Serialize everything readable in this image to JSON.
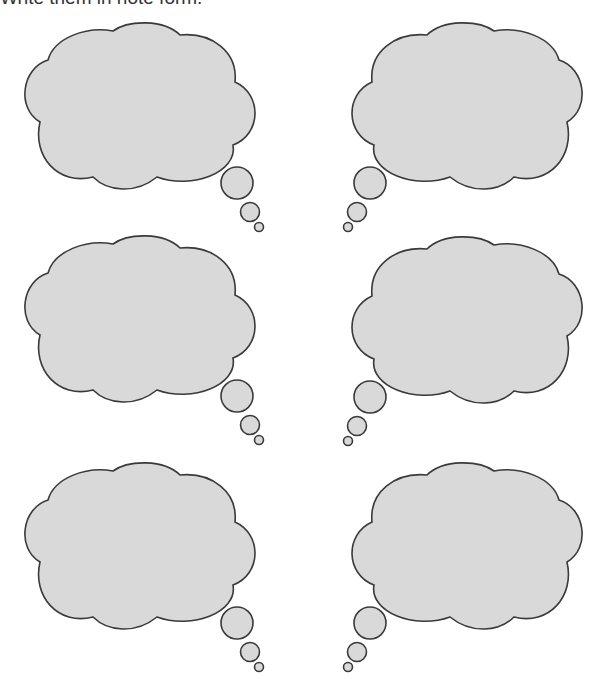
{
  "worksheet": {
    "instruction": "Write them in note form."
  },
  "colors": {
    "cloud_fill": "#d9d9d9",
    "cloud_stroke": "#3a3a3a",
    "background": "#ffffff"
  },
  "thought_bubbles": [
    {
      "id": 1,
      "position": "top-left",
      "tail_side": "right",
      "text": ""
    },
    {
      "id": 2,
      "position": "top-right",
      "tail_side": "left",
      "text": ""
    },
    {
      "id": 3,
      "position": "middle-left",
      "tail_side": "right",
      "text": ""
    },
    {
      "id": 4,
      "position": "middle-right",
      "tail_side": "left",
      "text": ""
    },
    {
      "id": 5,
      "position": "bottom-left",
      "tail_side": "right",
      "text": ""
    },
    {
      "id": 6,
      "position": "bottom-right",
      "tail_side": "left",
      "text": ""
    }
  ]
}
